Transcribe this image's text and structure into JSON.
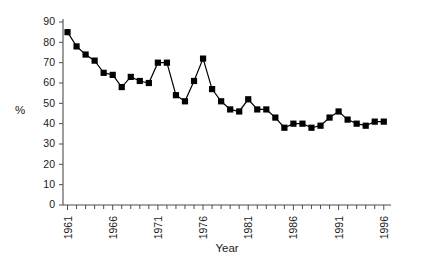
{
  "chart_data": {
    "type": "line",
    "title": "",
    "xlabel": "Year",
    "ylabel": "%",
    "xlim": [
      1960.5,
      1996.8
    ],
    "ylim": [
      0,
      90
    ],
    "grid": false,
    "legend": null,
    "marker": "filled-square",
    "ytick_labels": [
      "0",
      "10",
      "20",
      "30",
      "40",
      "50",
      "60",
      "70",
      "80",
      "90"
    ],
    "ytick_values": [
      0,
      10,
      20,
      30,
      40,
      50,
      60,
      70,
      80,
      90
    ],
    "xtick_labels": [
      "1961",
      "1966",
      "1971",
      "1976",
      "1981",
      "1986",
      "1991",
      "1996"
    ],
    "xtick_values": [
      1961,
      1966,
      1971,
      1976,
      1981,
      1986,
      1991,
      1996
    ],
    "xtick_minor_values": [
      1962,
      1963,
      1964,
      1965,
      1967,
      1968,
      1969,
      1970,
      1972,
      1973,
      1974,
      1975,
      1977,
      1978,
      1979,
      1980,
      1982,
      1983,
      1984,
      1985,
      1987,
      1988,
      1989,
      1990,
      1992,
      1993,
      1994,
      1995
    ],
    "x": [
      1961,
      1962,
      1963,
      1964,
      1965,
      1966,
      1967,
      1968,
      1969,
      1970,
      1971,
      1972,
      1973,
      1974,
      1975,
      1976,
      1977,
      1978,
      1979,
      1980,
      1981,
      1982,
      1983,
      1984,
      1985,
      1986,
      1987,
      1988,
      1989,
      1990,
      1991,
      1992,
      1993,
      1994,
      1995,
      1996
    ],
    "values": [
      85,
      78,
      74,
      71,
      65,
      64,
      58,
      63,
      61,
      60,
      70,
      70,
      54,
      51,
      61,
      72,
      57,
      51,
      47,
      46,
      52,
      47,
      47,
      43,
      38,
      40,
      40,
      38,
      39,
      43,
      46,
      42,
      40,
      39,
      41,
      41
    ],
    "series": [
      {
        "name": "percent",
        "color": "#000000",
        "values": [
          85,
          78,
          74,
          71,
          65,
          64,
          58,
          63,
          61,
          60,
          70,
          70,
          54,
          51,
          61,
          72,
          57,
          51,
          47,
          46,
          52,
          47,
          47,
          43,
          38,
          40,
          40,
          38,
          39,
          43,
          46,
          42,
          40,
          39,
          41,
          41
        ]
      }
    ]
  },
  "axis": {
    "x_title": "Year",
    "y_title": "%"
  }
}
